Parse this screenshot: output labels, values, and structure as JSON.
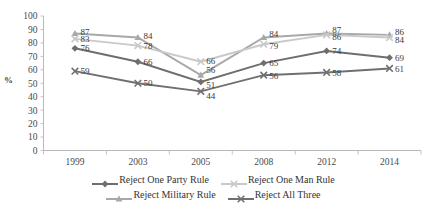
{
  "chart_data": {
    "type": "line",
    "title": "",
    "subtitle": "",
    "xlabel": "",
    "ylabel": "%",
    "ylim": [
      0,
      100
    ],
    "ytick_step": 10,
    "yticks": [
      "0",
      "10",
      "20",
      "30",
      "40",
      "50",
      "60",
      "70",
      "80",
      "90",
      "100"
    ],
    "categories": [
      "1999",
      "2003",
      "2005",
      "2008",
      "2012",
      "2014"
    ],
    "grid": false,
    "legend_position": "bottom",
    "series": [
      {
        "name": "Reject One Party Rule",
        "color": "#6e6e6e",
        "marker": "diamond",
        "values": [
          76,
          66,
          51,
          65,
          74,
          69
        ],
        "labels": [
          "76",
          "66",
          "51",
          "65",
          "74",
          "69"
        ]
      },
      {
        "name": "Reject One Man Rule",
        "color": "#c9c9c9",
        "marker": "x",
        "values": [
          83,
          78,
          66,
          79,
          86,
          84
        ],
        "labels": [
          "83",
          "78",
          "66",
          "79",
          "86",
          "84"
        ]
      },
      {
        "name": "Reject Military Rule",
        "color": "#a8a8a8",
        "marker": "triangle",
        "values": [
          87,
          84,
          56,
          84,
          87,
          86
        ],
        "labels": [
          "87",
          "84",
          "56",
          "84",
          "87",
          "86"
        ]
      },
      {
        "name": "Reject All Three",
        "color": "#707070",
        "marker": "x",
        "values": [
          59,
          50,
          44,
          56,
          58,
          61
        ],
        "labels": [
          "59",
          "50",
          "44",
          "56",
          "58",
          "61"
        ]
      }
    ]
  },
  "legend": {
    "row1": [
      {
        "label": "Reject One Party Rule",
        "color": "#6e6e6e",
        "marker": "diamond"
      },
      {
        "label": "Reject One Man Rule",
        "color": "#c9c9c9",
        "marker": "x"
      }
    ],
    "row2": [
      {
        "label": "Reject Military Rule",
        "color": "#a8a8a8",
        "marker": "triangle"
      },
      {
        "label": "Reject All Three",
        "color": "#707070",
        "marker": "x"
      }
    ]
  },
  "axis": {
    "y_label": "%",
    "y_ticks": [
      "100",
      "90",
      "80",
      "70",
      "60",
      "50",
      "40",
      "30",
      "20",
      "10",
      "0"
    ],
    "x_ticks": [
      "1999",
      "2003",
      "2005",
      "2008",
      "2012",
      "2014"
    ]
  }
}
